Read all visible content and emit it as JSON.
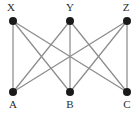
{
  "figure": {
    "background_color": "#ffffff"
  },
  "chart_data": {
    "type": "diagram",
    "diagram_kind": "graph",
    "title": "",
    "xlabel": "",
    "ylabel": "",
    "edge_color": "#8c8c8c",
    "vertex_color": "#1a1a1a",
    "label_color": "#2b2b2b",
    "vertex_radius": 4,
    "edge_width": 1.25,
    "nodes": [
      {
        "id": "X",
        "label": "X",
        "x": 13,
        "y": 21,
        "label_x": 11,
        "label_y": 11,
        "label_anchor": "middle",
        "group": "top"
      },
      {
        "id": "Y",
        "label": "Y",
        "x": 70,
        "y": 21,
        "label_x": 70,
        "label_y": 11,
        "label_anchor": "middle",
        "group": "top"
      },
      {
        "id": "Z",
        "label": "Z",
        "x": 127,
        "y": 21,
        "label_x": 126,
        "label_y": 11,
        "label_anchor": "middle",
        "group": "top"
      },
      {
        "id": "A",
        "label": "A",
        "x": 13,
        "y": 92,
        "label_x": 13,
        "label_y": 108,
        "label_anchor": "middle",
        "group": "bottom"
      },
      {
        "id": "B",
        "label": "B",
        "x": 70,
        "y": 92,
        "label_x": 70,
        "label_y": 108,
        "label_anchor": "middle",
        "group": "bottom"
      },
      {
        "id": "C",
        "label": "C",
        "x": 127,
        "y": 92,
        "label_x": 127,
        "label_y": 108,
        "label_anchor": "middle",
        "group": "bottom"
      }
    ],
    "edges": [
      {
        "from": "X",
        "to": "A"
      },
      {
        "from": "X",
        "to": "B"
      },
      {
        "from": "X",
        "to": "C"
      },
      {
        "from": "Y",
        "to": "A"
      },
      {
        "from": "Y",
        "to": "B"
      },
      {
        "from": "Y",
        "to": "C"
      },
      {
        "from": "Z",
        "to": "A"
      },
      {
        "from": "Z",
        "to": "B"
      },
      {
        "from": "Z",
        "to": "C"
      }
    ]
  }
}
